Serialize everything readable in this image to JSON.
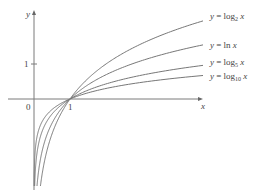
{
  "chart_data": {
    "type": "line",
    "title": "",
    "xlabel": "x",
    "ylabel": "y",
    "x_ticks": [
      {
        "value": 0,
        "label": "0"
      },
      {
        "value": 1,
        "label": "1"
      }
    ],
    "y_ticks": [
      {
        "value": 1,
        "label": "1"
      }
    ],
    "xlim": [
      -0.95,
      4.7
    ],
    "ylim": [
      -2.4,
      2.7
    ],
    "grid": false,
    "legend_position": "inline-right",
    "series": [
      {
        "name": "y = log2 x",
        "label_main": "y = log",
        "label_sub": "2",
        "label_tail": " x",
        "base": 2
      },
      {
        "name": "y = ln x",
        "label_main": "y = ln ",
        "label_sub": "",
        "label_tail": "x",
        "base": 2.718281828
      },
      {
        "name": "y = log5 x",
        "label_main": "y = log",
        "label_sub": "5",
        "label_tail": " x",
        "base": 5
      },
      {
        "name": "y = log10 x",
        "label_main": "y = log",
        "label_sub": "10",
        "label_tail": " x",
        "base": 10
      }
    ],
    "annotations": [
      "All curves pass through (1, 0)"
    ]
  },
  "layout": {
    "origin_px": [
      34,
      99
    ],
    "unit_px": [
      36,
      35
    ],
    "x_end_px": 203,
    "y_bottom_px": 186,
    "label_x_px": 210,
    "label_y_px": [
      19,
      48,
      65,
      79
    ]
  }
}
